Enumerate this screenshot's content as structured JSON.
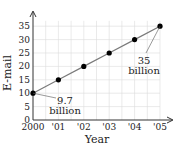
{
  "chart_data": {
    "type": "line",
    "title": "",
    "xlabel": "Year",
    "ylabel": "E-mail",
    "categories": [
      "2000",
      "'01",
      "'02",
      "'03",
      "'04",
      "'05"
    ],
    "x": [
      2000,
      2001,
      2002,
      2003,
      2004,
      2005
    ],
    "series": [
      {
        "name": "E-mail",
        "values": [
          10,
          15,
          20,
          25,
          30,
          35
        ]
      }
    ],
    "yticks": [
      "0",
      "5",
      "10",
      "15",
      "20",
      "25",
      "30",
      "35"
    ],
    "ylim": [
      0,
      37
    ],
    "grid": true,
    "legend": null,
    "annotations": [
      {
        "line1": "9.7",
        "line2": "billion",
        "points_to": "2000"
      },
      {
        "line1": "35",
        "line2": "billion",
        "points_to": "'05"
      }
    ],
    "colors": {
      "line": "#7a7a7a",
      "marker": "#000000",
      "grid": "#dcdcdc",
      "axis": "#333333"
    }
  }
}
